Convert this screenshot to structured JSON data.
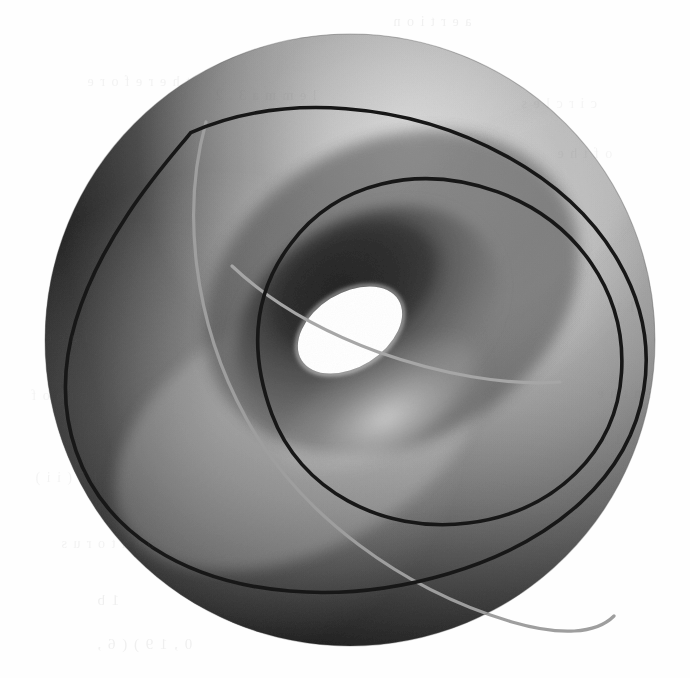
{
  "figure": {
    "title": "Torus with two Villarceau circles",
    "kind": "3d-surface-illustration",
    "alt": "A shaded grey torus (donut) seen from an oblique angle, with two large circles drawn on its surface crossing each other",
    "medium": "scanned book page, greyscale halftone"
  },
  "canvas": {
    "width": 690,
    "height": 678,
    "background_color": "#fefefe",
    "paper_tint": "#fdfdfc"
  },
  "colors": {
    "outline_visible": "#1a1a1a",
    "outline_hidden": "#9a9a9a",
    "highlight": "#e9e9e9",
    "midtone": "#b4b4b4",
    "shadow": "#6d6d6d",
    "deep_shadow": "#4c4c4c",
    "hole_fill": "#ffffff",
    "inner_shadow": "#7e7e7e"
  },
  "geometry": {
    "outer_silhouette": {
      "shape": "ellipse",
      "cx": 350,
      "cy": 340,
      "rx": 305,
      "ry": 306,
      "rotation_deg": 0
    },
    "hole": {
      "shape": "ellipse",
      "cx": 350,
      "cy": 330,
      "rx": 57,
      "ry": 37,
      "rotation_deg": -32
    },
    "inner_throat": {
      "shape": "ellipse",
      "cx": 368,
      "cy": 318,
      "rx": 118,
      "ry": 80,
      "rotation_deg": -30
    },
    "curve_large": {
      "label": "large Villarceau circle",
      "cx": 352,
      "cy": 368,
      "rx": 292,
      "ry": 190,
      "rotation_deg": -27
    },
    "curve_small": {
      "label": "small Villarceau circle",
      "cx": 412,
      "cy": 356,
      "rx": 185,
      "ry": 170,
      "rotation_deg": -22
    },
    "crossings": [
      {
        "name": "upper-left-crossing",
        "x": 208,
        "y": 126
      },
      {
        "name": "upper-inner-crossing",
        "x": 287,
        "y": 249
      },
      {
        "name": "lower-inner-crossing",
        "x": 418,
        "y": 382
      },
      {
        "name": "lower-right-crossing",
        "x": 591,
        "y": 504
      }
    ]
  },
  "ghost_text": {
    "note": "faint show-through of printing from the reverse side of the scanned page",
    "lines": [
      {
        "text": "a  e  r  t  i  o  n",
        "x": 392,
        "y": 14,
        "size": 14,
        "opacity": 0.1
      },
      {
        "text": "t  h  e  r  e  f  o  r  e",
        "x": 86,
        "y": 74,
        "size": 14,
        "opacity": 0.09
      },
      {
        "text": "l  e  m  m  a    3 . 2",
        "x": 214,
        "y": 88,
        "size": 14,
        "opacity": 0.08
      },
      {
        "text": "c  i  r  c  l  e  s",
        "x": 520,
        "y": 96,
        "size": 14,
        "opacity": 0.07
      },
      {
        "text": "o  f    t  h  e",
        "x": 556,
        "y": 146,
        "size": 14,
        "opacity": 0.07
      },
      {
        "text": "s  u  r  f  a  c  e",
        "x": 44,
        "y": 330,
        "size": 14,
        "opacity": 0.08
      },
      {
        "text": "p  r  o  o  f",
        "x": 30,
        "y": 388,
        "size": 14,
        "opacity": 0.08
      },
      {
        "text": "4 . 1 7    ( i i )",
        "x": 34,
        "y": 470,
        "size": 14,
        "opacity": 0.08
      },
      {
        "text": "b  e    a    t  o  r  u  s",
        "x": 60,
        "y": 536,
        "size": 14,
        "opacity": 0.09
      },
      {
        "text": "1   b",
        "x": 96,
        "y": 592,
        "size": 15,
        "opacity": 0.11
      },
      {
        "text": "0 ,    1 9 ) ( 6 ,",
        "x": 96,
        "y": 636,
        "size": 15,
        "opacity": 0.11
      },
      {
        "text": "i  n    t  h  e",
        "x": 596,
        "y": 386,
        "size": 14,
        "opacity": 0.07
      },
      {
        "text": "6    1 1",
        "x": 600,
        "y": 432,
        "size": 14,
        "opacity": 0.08
      },
      {
        "text": "1 1",
        "x": 614,
        "y": 300,
        "size": 14,
        "opacity": 0.07
      }
    ]
  },
  "annotations": {
    "visible_curve_count": 2,
    "hidden_arc_count": 2,
    "light_direction": "upper-right"
  }
}
